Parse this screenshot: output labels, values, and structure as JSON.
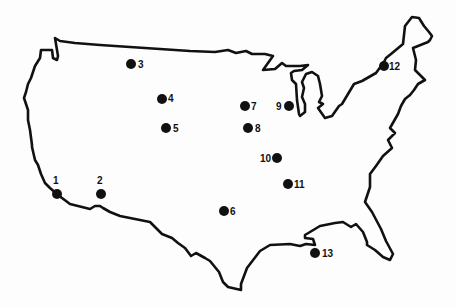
{
  "map": {
    "title": "",
    "region": "Contiguous United States",
    "style": {
      "ink_color": "#111111",
      "background_color": "#fdfdfd"
    },
    "sites": [
      {
        "id": "1",
        "label": "1",
        "approx_location": "Southern California coast",
        "label_side": "top"
      },
      {
        "id": "2",
        "label": "2",
        "approx_location": "Southern California / Arizona",
        "label_side": "top"
      },
      {
        "id": "3",
        "label": "3",
        "approx_location": "Northern Idaho / Montana",
        "label_side": "right"
      },
      {
        "id": "4",
        "label": "4",
        "approx_location": "Wyoming",
        "label_side": "right"
      },
      {
        "id": "5",
        "label": "5",
        "approx_location": "Colorado / Utah",
        "label_side": "right"
      },
      {
        "id": "6",
        "label": "6",
        "approx_location": "Texas",
        "label_side": "right"
      },
      {
        "id": "7",
        "label": "7",
        "approx_location": "Iowa",
        "label_side": "right"
      },
      {
        "id": "8",
        "label": "8",
        "approx_location": "Missouri",
        "label_side": "right"
      },
      {
        "id": "9",
        "label": "9",
        "approx_location": "Illinois near Lake Michigan",
        "label_side": "left"
      },
      {
        "id": "10",
        "label": "10",
        "approx_location": "Kentucky / Tennessee",
        "label_side": "left"
      },
      {
        "id": "11",
        "label": "11",
        "approx_location": "Alabama",
        "label_side": "right"
      },
      {
        "id": "12",
        "label": "12",
        "approx_location": "New York / Vermont",
        "label_side": "right"
      },
      {
        "id": "13",
        "label": "13",
        "approx_location": "Florida panhandle coast",
        "label_side": "right"
      }
    ]
  }
}
